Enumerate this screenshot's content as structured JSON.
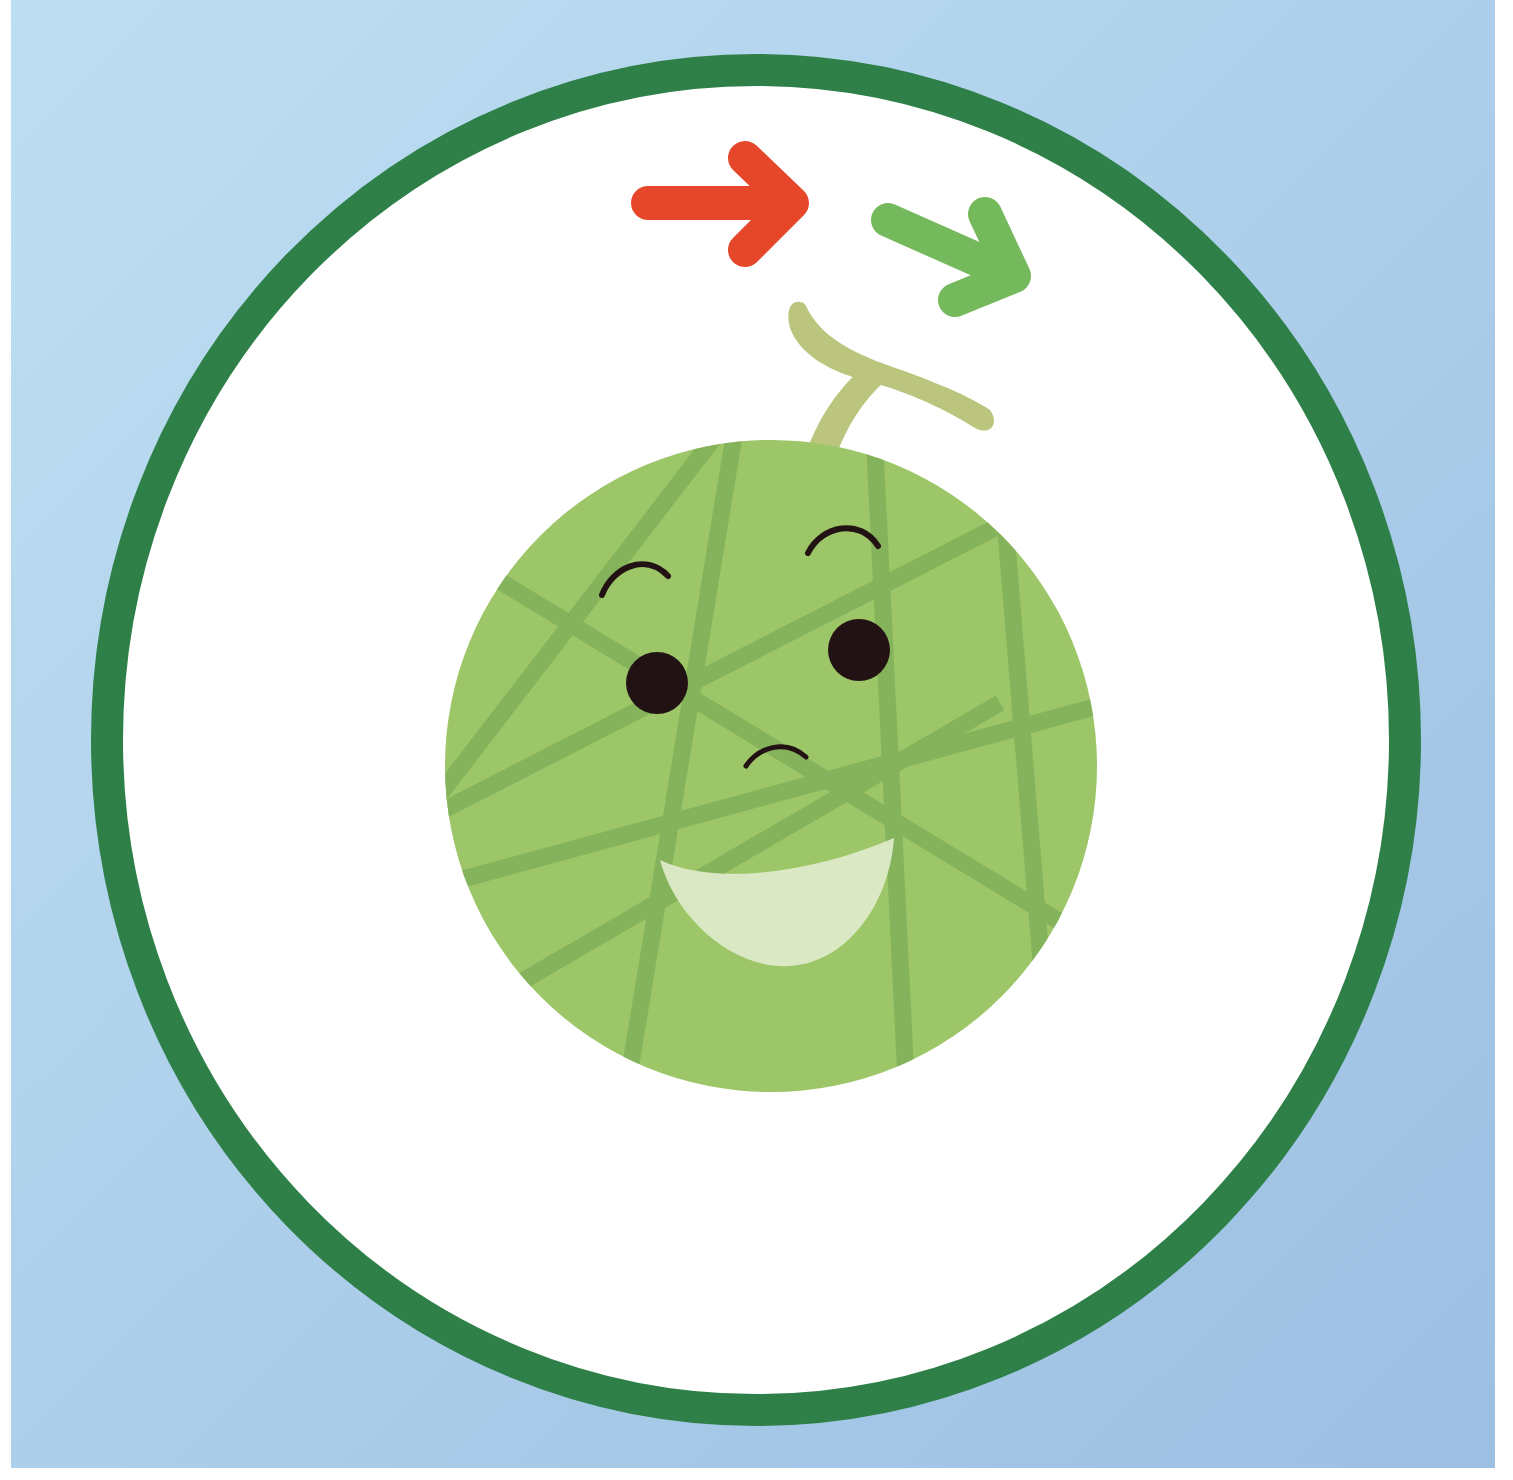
{
  "illustration": {
    "subject": "smiling melon character",
    "caption": "",
    "colors": {
      "background_top_left": "#BCDDF1",
      "background_bottom_right": "#9DC1E4",
      "ring": "#2E8048",
      "ring_inner": "#FFFFFF",
      "melon_body": "#9CC667",
      "melon_net": "#7FAF5A",
      "stem": "#BCC57E",
      "eyes": "#231214",
      "mouth": "#DDEBC8",
      "arrow_red": "#E6472A",
      "arrow_green": "#74BA5C"
    },
    "icons": [
      "arrow-right-icon",
      "arrow-down-right-icon"
    ]
  }
}
